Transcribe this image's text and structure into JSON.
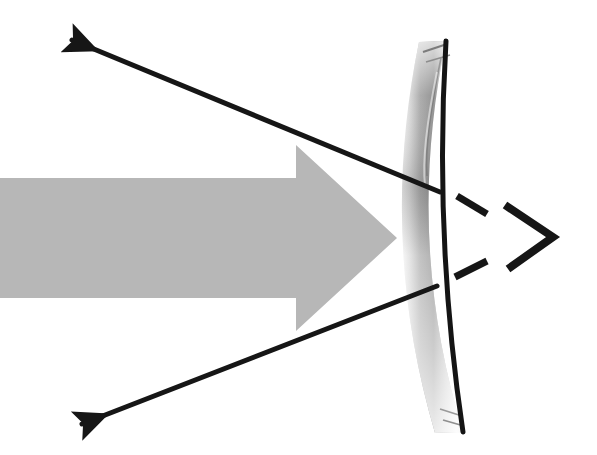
{
  "figure": {
    "background_color": "#ffffff",
    "width": 597,
    "height": 455
  },
  "palette": {
    "ray_color": "#161616",
    "incident_beam_gray": "#b7b7b7",
    "mirror_edge_dark": "#141414",
    "mirror_face_light": "#fafafa",
    "mirror_face_mid": "#c9c9c9",
    "mirror_face_dark": "#8a8a8a",
    "mirror_highlight": "#efefef"
  },
  "elements": {
    "incident_beam": {
      "name": "incident-light-beam",
      "shape": "block-arrow",
      "direction": "right",
      "label": "",
      "shaft_top_y": 178,
      "shaft_bottom_y": 298,
      "shaft_left_x": 0,
      "head_base_x": 296,
      "head_top_y": 145,
      "head_bottom_y": 331,
      "tip_x": 397,
      "tip_y": 238,
      "fill": "#b7b7b7"
    },
    "mirror": {
      "name": "concave-mirror",
      "shape": "curved-band-arc",
      "opening_direction": "left",
      "top_point": {
        "x": 446,
        "y": 41
      },
      "vertex_point": {
        "x": 434,
        "y": 238
      },
      "bottom_point": {
        "x": 463,
        "y": 432
      },
      "band_thickness": 28,
      "reflective_edge": "right",
      "edge_stroke_width": 5
    },
    "reflected_ray_upper": {
      "name": "reflected-ray-upper",
      "from": {
        "x": 440,
        "y": 192
      },
      "to": {
        "x": 72,
        "y": 40
      },
      "arrow_at": "to",
      "stroke_width": 5
    },
    "reflected_ray_lower": {
      "name": "reflected-ray-lower",
      "from": {
        "x": 437,
        "y": 286
      },
      "to": {
        "x": 82,
        "y": 424
      },
      "arrow_at": "to",
      "stroke_width": 5
    },
    "focal_marker": {
      "name": "focal-point-chevron",
      "shape": "chevron-right",
      "apex": {
        "x": 553,
        "y": 237
      },
      "top_end": {
        "x": 505,
        "y": 205
      },
      "bottom_end": {
        "x": 508,
        "y": 269
      },
      "stroke_width": 8
    },
    "dash_upper": {
      "name": "dashed-extension-upper",
      "from": {
        "x": 457,
        "y": 196
      },
      "to": {
        "x": 487,
        "y": 214
      },
      "stroke_width": 7,
      "style": "dashed-segment"
    },
    "dash_lower": {
      "name": "dashed-extension-lower",
      "from": {
        "x": 455,
        "y": 277
      },
      "to": {
        "x": 487,
        "y": 261
      },
      "stroke_width": 7,
      "style": "dashed-segment"
    }
  },
  "annotations": {
    "caption": "",
    "notes": ""
  }
}
